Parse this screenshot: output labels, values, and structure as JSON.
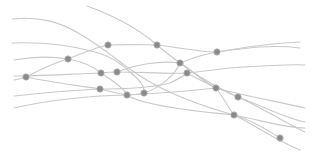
{
  "diagram": {
    "type": "network-curves",
    "title": "",
    "colors": {
      "background": "#ffffff",
      "line": "#c9c9c9",
      "node_fill": "#8a8a8a",
      "node_stroke": "#a9a9a9"
    },
    "node_count": 16,
    "line_count": 10,
    "labels": []
  }
}
